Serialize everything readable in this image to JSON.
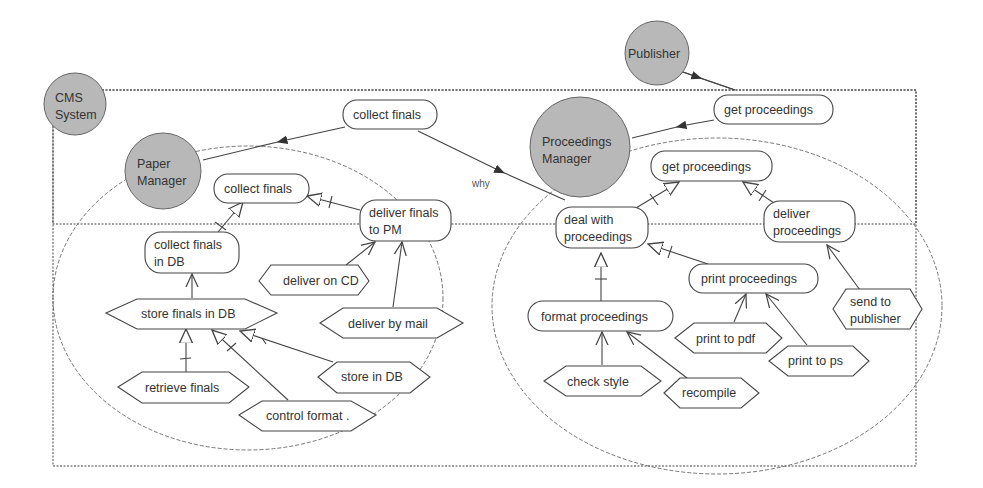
{
  "diagram": {
    "boundary": {
      "label": "CMS System"
    },
    "actors": [
      {
        "id": "cms",
        "label_lines": [
          "CMS",
          "System"
        ]
      },
      {
        "id": "paper_manager",
        "label_lines": [
          "Paper",
          "Manager"
        ]
      },
      {
        "id": "proceedings_manager",
        "label_lines": [
          "Proceedings",
          "Manager"
        ]
      },
      {
        "id": "publisher",
        "label_lines": [
          "Publisher"
        ]
      }
    ],
    "goals": [
      {
        "id": "g_collect_top",
        "label_lines": [
          "collect finals"
        ]
      },
      {
        "id": "g_get_top",
        "label_lines": [
          "get proceedings"
        ]
      },
      {
        "id": "g_collect",
        "label_lines": [
          "collect finals"
        ]
      },
      {
        "id": "g_collect_db",
        "label_lines": [
          "collect finals",
          "in DB"
        ]
      },
      {
        "id": "g_deliver_pm",
        "label_lines": [
          "deliver finals",
          "to PM"
        ]
      },
      {
        "id": "g_get",
        "label_lines": [
          "get proceedings"
        ]
      },
      {
        "id": "g_deal",
        "label_lines": [
          "deal with",
          "proceedings"
        ]
      },
      {
        "id": "g_deliver_proc",
        "label_lines": [
          "deliver",
          "proceedings"
        ]
      },
      {
        "id": "g_print",
        "label_lines": [
          "print proceedings"
        ]
      },
      {
        "id": "g_format",
        "label_lines": [
          "format proceedings"
        ]
      }
    ],
    "tasks": [
      {
        "id": "t_deliver_cd",
        "label_lines": [
          "deliver on CD"
        ]
      },
      {
        "id": "t_store_finals",
        "label_lines": [
          "store finals in DB"
        ]
      },
      {
        "id": "t_deliver_mail",
        "label_lines": [
          "deliver by mail"
        ]
      },
      {
        "id": "t_retrieve",
        "label_lines": [
          "retrieve finals"
        ]
      },
      {
        "id": "t_store_db",
        "label_lines": [
          "store in DB"
        ]
      },
      {
        "id": "t_control",
        "label_lines": [
          "control format ."
        ]
      },
      {
        "id": "t_send_pub",
        "label_lines": [
          "send to",
          "publisher"
        ]
      },
      {
        "id": "t_print_pdf",
        "label_lines": [
          "print to pdf"
        ]
      },
      {
        "id": "t_print_ps",
        "label_lines": [
          "print to ps"
        ]
      },
      {
        "id": "t_check",
        "label_lines": [
          "check style"
        ]
      },
      {
        "id": "t_recompile",
        "label_lines": [
          "recompile"
        ]
      }
    ],
    "link_labels": {
      "why": "why"
    },
    "colors": {
      "actor_fill": "#b8b8b8",
      "stroke": "#555555",
      "text": "#333333"
    }
  }
}
